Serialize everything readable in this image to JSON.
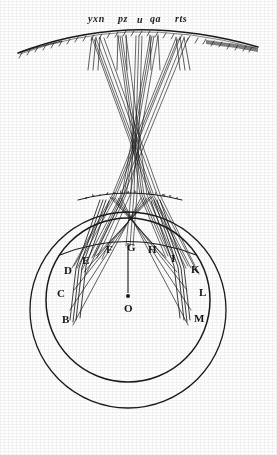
{
  "figure": {
    "ink_color": "#1a1a1a",
    "paper_color": "#ffffff"
  },
  "top_labels": [
    {
      "id": "yxn",
      "text": "yxn",
      "x": 88,
      "y": 14
    },
    {
      "id": "pz",
      "text": "pz",
      "x": 118,
      "y": 14
    },
    {
      "id": "u",
      "text": "u",
      "x": 137,
      "y": 15
    },
    {
      "id": "qa",
      "text": "qa",
      "x": 150,
      "y": 14
    },
    {
      "id": "rts",
      "text": "rts",
      "x": 175,
      "y": 14
    }
  ],
  "micro_labels": [
    {
      "text": "a",
      "x": 85,
      "y": 196
    },
    {
      "text": "b",
      "x": 92,
      "y": 194
    },
    {
      "text": "c",
      "x": 99,
      "y": 193
    },
    {
      "text": "d",
      "x": 106,
      "y": 192
    },
    {
      "text": "e",
      "x": 113,
      "y": 191
    },
    {
      "text": "f",
      "x": 120,
      "y": 190
    },
    {
      "text": "g",
      "x": 127,
      "y": 190
    },
    {
      "text": "h",
      "x": 134,
      "y": 190
    },
    {
      "text": "i",
      "x": 141,
      "y": 190
    },
    {
      "text": "k",
      "x": 148,
      "y": 191
    },
    {
      "text": "l",
      "x": 155,
      "y": 192
    },
    {
      "text": "m",
      "x": 162,
      "y": 193
    },
    {
      "text": "n",
      "x": 169,
      "y": 194
    },
    {
      "text": "o",
      "x": 176,
      "y": 196
    }
  ],
  "sphere_labels": [
    {
      "id": "B",
      "text": "B",
      "x": 62,
      "y": 314
    },
    {
      "id": "C",
      "text": "C",
      "x": 57,
      "y": 288
    },
    {
      "id": "D",
      "text": "D",
      "x": 64,
      "y": 265
    },
    {
      "id": "E",
      "text": "E",
      "x": 82,
      "y": 255
    },
    {
      "id": "F",
      "text": "F",
      "x": 106,
      "y": 244
    },
    {
      "id": "G",
      "text": "G",
      "x": 127,
      "y": 242
    },
    {
      "id": "H",
      "text": "H",
      "x": 148,
      "y": 244
    },
    {
      "id": "I",
      "text": "I",
      "x": 171,
      "y": 253
    },
    {
      "id": "K",
      "text": "K",
      "x": 191,
      "y": 264
    },
    {
      "id": "L",
      "text": "L",
      "x": 199,
      "y": 287
    },
    {
      "id": "M",
      "text": "M",
      "x": 194,
      "y": 313
    },
    {
      "id": "O",
      "text": "O",
      "x": 124,
      "y": 303
    }
  ],
  "geometry": {
    "outer_circle": {
      "cx": 128,
      "cy": 310,
      "r": 98
    },
    "inner_circle": {
      "cx": 128,
      "cy": 300,
      "r": 82
    },
    "center_point": {
      "cx": 128,
      "cy": 296
    },
    "axis_line": {
      "x": 128,
      "y1": 243,
      "y2": 296
    }
  }
}
